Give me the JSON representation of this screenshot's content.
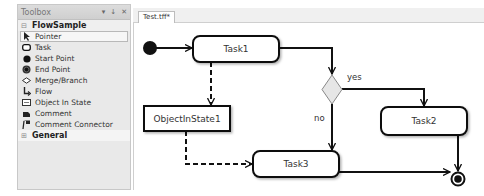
{
  "toolbox": {
    "title": "Toolbox",
    "header_buttons": [
      "▾",
      "↓",
      "✕"
    ],
    "groups": [
      {
        "label": "FlowSample",
        "expanded": true,
        "items": [
          {
            "label": "Pointer",
            "icon": "pointer-icon",
            "selected": true
          },
          {
            "label": "Task",
            "icon": "task-icon"
          },
          {
            "label": "Start Point",
            "icon": "start-point-icon"
          },
          {
            "label": "End Point",
            "icon": "end-point-icon"
          },
          {
            "label": "Merge/Branch",
            "icon": "merge-branch-icon"
          },
          {
            "label": "Flow",
            "icon": "flow-icon"
          },
          {
            "label": "Object In State",
            "icon": "object-in-state-icon"
          },
          {
            "label": "Comment",
            "icon": "comment-icon"
          },
          {
            "label": "Comment Connector",
            "icon": "comment-connector-icon"
          }
        ]
      },
      {
        "label": "General",
        "expanded": false,
        "items": []
      }
    ]
  },
  "document": {
    "tab_label": "Test.tff*"
  },
  "diagram": {
    "nodes": {
      "task1": "Task1",
      "task2": "Task2",
      "task3": "Task3",
      "object_in_state": "ObjectInState1"
    },
    "edge_labels": {
      "yes": "yes",
      "no": "no"
    },
    "colors": {
      "stroke": "#111111",
      "diamond_fill": "#e6e6e6",
      "node_fill": "#ffffff"
    }
  }
}
